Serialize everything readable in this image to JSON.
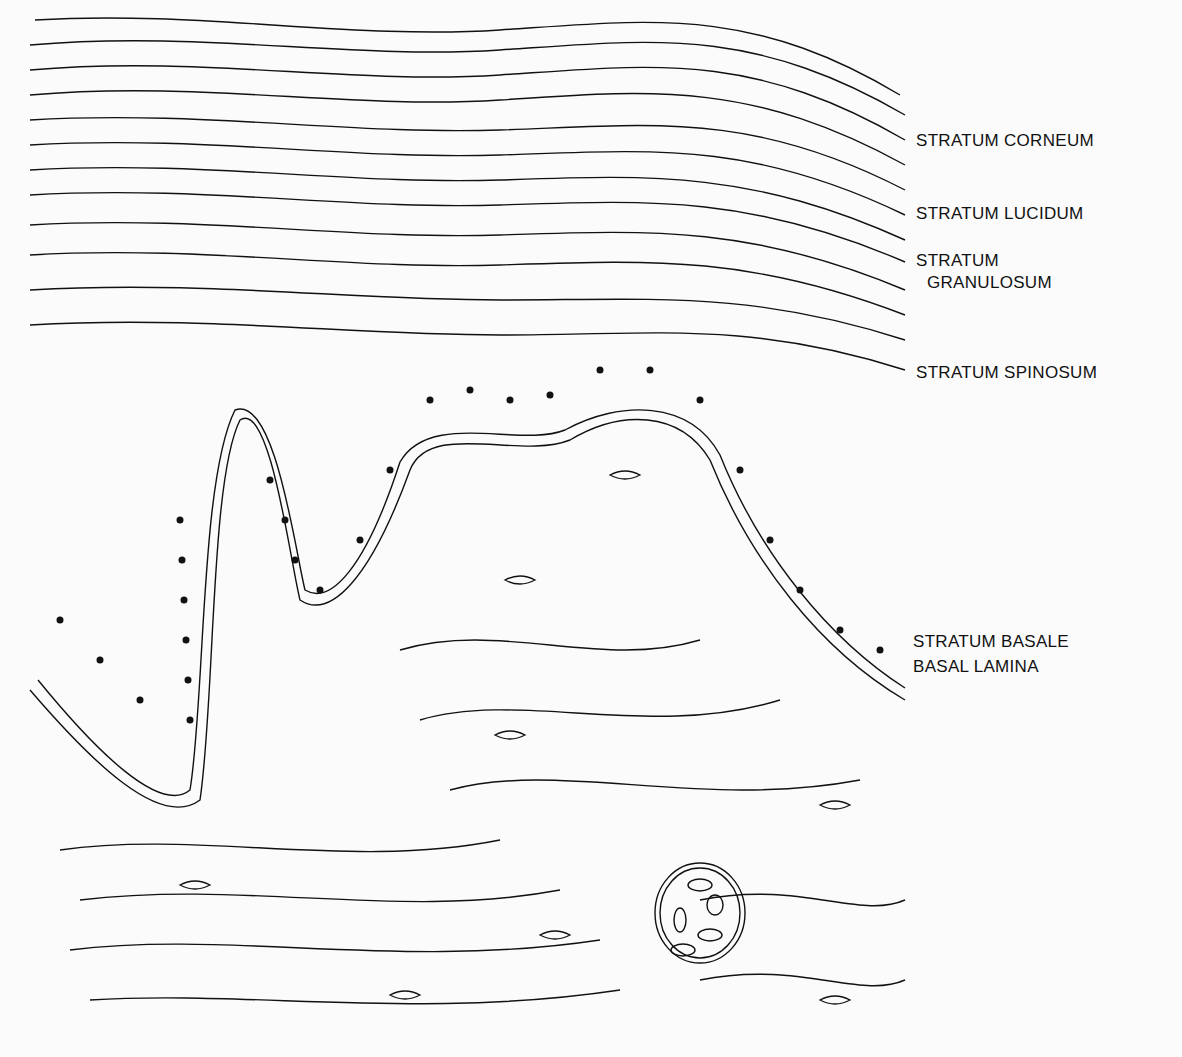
{
  "figure": {
    "labels": [
      {
        "id": "corneum",
        "text": "STRATUM CORNEUM",
        "x": 916,
        "y": 130
      },
      {
        "id": "lucidum",
        "text": "STRATUM LUCIDUM",
        "x": 916,
        "y": 203
      },
      {
        "id": "granulosum_1",
        "text": "STRATUM",
        "x": 916,
        "y": 250
      },
      {
        "id": "granulosum_2",
        "text": "GRANULOSUM",
        "x": 927,
        "y": 272
      },
      {
        "id": "spinosum",
        "text": "STRATUM SPINOSUM",
        "x": 916,
        "y": 362
      },
      {
        "id": "basale",
        "text": "STRATUM BASALE",
        "x": 913,
        "y": 631
      },
      {
        "id": "lamina",
        "text": "BASAL LAMINA",
        "x": 913,
        "y": 656
      }
    ],
    "colors": {
      "ink": "#111111",
      "paper": "#fbfbfb"
    }
  }
}
